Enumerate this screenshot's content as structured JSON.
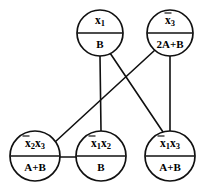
{
  "diagram": {
    "background_color": "#ffffff",
    "line_color": "#101010",
    "text_color": "#000000",
    "nodes": [
      {
        "id": "node-x1",
        "name": "node-x1",
        "top_label": "x1",
        "top_label_display": "x₁",
        "bottom_label": "B",
        "overbar": false,
        "cx": 100,
        "cy": 33,
        "r": 23
      },
      {
        "id": "node-x3bar",
        "name": "node-x3bar",
        "top_label": "x̅3",
        "top_label_display": "x̄₃",
        "bottom_label": "2A+B",
        "overbar": true,
        "cx": 170,
        "cy": 33,
        "r": 23
      },
      {
        "id": "node-x2bar-x3",
        "name": "node-x2bar-x3",
        "top_label": "x̄2x3",
        "top_label_display": "x̄₂x₃",
        "bottom_label": "A+B",
        "overbar": true,
        "cx": 35,
        "cy": 156,
        "r": 25
      },
      {
        "id": "node-x1bar-x2",
        "name": "node-x1bar-x2",
        "top_label": "x̄1x2",
        "top_label_display": "x̄₁x₂",
        "bottom_label": "B",
        "overbar": true,
        "cx": 101,
        "cy": 156,
        "r": 25
      },
      {
        "id": "node-x1bar-x3",
        "name": "node-x1bar-x3",
        "top_label": "x̄1x3",
        "top_label_display": "x̄₁x₃",
        "bottom_label": "A+B",
        "overbar": true,
        "cx": 170,
        "cy": 156,
        "r": 25
      }
    ],
    "edges": [
      {
        "name": "edge-x1-to-x1bar-x2",
        "from": "node-x1",
        "to": "node-x1bar-x2",
        "x1": 100,
        "y1": 56,
        "x2": 101,
        "y2": 131
      },
      {
        "name": "edge-x1-to-x1bar-x3",
        "from": "node-x1",
        "to": "node-x1bar-x3",
        "x1": 110,
        "y1": 53,
        "x2": 163,
        "y2": 132
      },
      {
        "name": "edge-x3bar-to-x2bar-x3",
        "from": "node-x3bar",
        "to": "node-x2bar-x3",
        "x1": 155,
        "y1": 50,
        "x2": 55,
        "y2": 142
      },
      {
        "name": "edge-x3bar-to-x1bar-x3",
        "from": "node-x3bar",
        "to": "node-x1bar-x3",
        "x1": 170,
        "y1": 56,
        "x2": 170,
        "y2": 131
      },
      {
        "name": "edge-x2bar-x3-to-x1bar-x2",
        "from": "node-x2bar-x3",
        "to": "node-x1bar-x2",
        "x1": 60,
        "y1": 157,
        "x2": 76,
        "y2": 157
      }
    ]
  }
}
